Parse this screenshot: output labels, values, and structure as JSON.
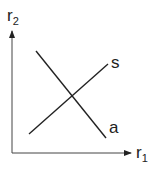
{
  "diagram": {
    "axes": {
      "y_label": "r",
      "y_label_sub": "2",
      "x_label": "r",
      "x_label_sub": "1",
      "origin": [
        12,
        153
      ],
      "y_axis_end": [
        12,
        30
      ],
      "x_axis_end": [
        132,
        153
      ]
    },
    "lines": [
      {
        "name": "s",
        "label": "s",
        "from": [
          29,
          134
        ],
        "to": [
          108,
          64
        ],
        "label_pos": [
          111,
          68
        ]
      },
      {
        "name": "a",
        "label": "a",
        "from": [
          36,
          51
        ],
        "to": [
          106,
          138
        ],
        "label_pos": [
          109,
          133
        ]
      }
    ],
    "colors": {
      "stroke": "#222222",
      "background": "#ffffff"
    }
  }
}
